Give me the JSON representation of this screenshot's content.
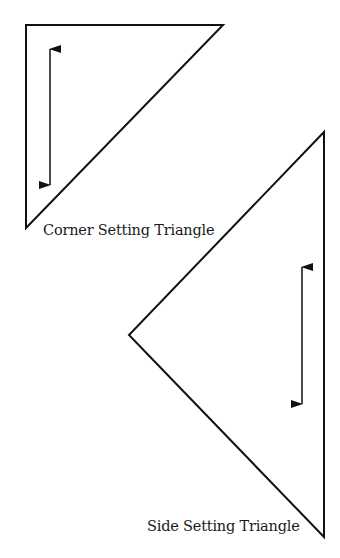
{
  "diagram": {
    "stroke_color": "#111111",
    "background": "#ffffff",
    "shapes": [
      {
        "id": "corner-setting-triangle",
        "label": "Corner Setting Triangle",
        "vertices": [
          [
            26,
            25
          ],
          [
            223,
            25
          ],
          [
            26,
            228
          ]
        ],
        "arrow": {
          "x": 50,
          "y1": 47,
          "y2": 187,
          "direction": "vertical-double"
        }
      },
      {
        "id": "side-setting-triangle",
        "label": "Side Setting Triangle",
        "vertices": [
          [
            324,
            132
          ],
          [
            129,
            335
          ],
          [
            324,
            537
          ]
        ],
        "arrow": {
          "x": 302,
          "y1": 265,
          "y2": 406,
          "direction": "vertical-double"
        }
      }
    ]
  },
  "labels": {
    "corner": "Corner Setting Triangle",
    "side": "Side Setting Triangle"
  }
}
